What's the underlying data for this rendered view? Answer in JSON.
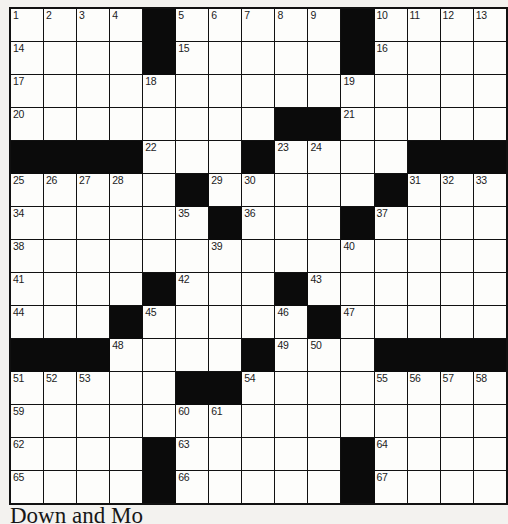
{
  "document": {
    "type": "crossword-puzzle-grid",
    "rows": 16,
    "columns": 15,
    "colors": {
      "page_background": "#f3f2ef",
      "cell_fill": "#fdfdfb",
      "block_fill": "#0b0b0b",
      "grid_line": "#111111",
      "number_text": "#1b1b1b"
    }
  },
  "caption": {
    "text": "Down and Mo"
  },
  "grid": {
    "legend": {
      "0": "open white cell",
      "1": "black blocked cell"
    },
    "blocks": [
      [
        0,
        0,
        0,
        0,
        1,
        0,
        0,
        0,
        0,
        0,
        1,
        0,
        0,
        0,
        0
      ],
      [
        0,
        0,
        0,
        0,
        1,
        0,
        0,
        0,
        0,
        0,
        1,
        0,
        0,
        0,
        0
      ],
      [
        0,
        0,
        0,
        0,
        0,
        0,
        0,
        0,
        0,
        0,
        0,
        0,
        0,
        0,
        0
      ],
      [
        0,
        0,
        0,
        0,
        0,
        0,
        0,
        0,
        1,
        1,
        0,
        0,
        0,
        0,
        0
      ],
      [
        1,
        1,
        1,
        1,
        0,
        0,
        0,
        1,
        0,
        0,
        0,
        0,
        1,
        1,
        1
      ],
      [
        0,
        0,
        0,
        0,
        0,
        1,
        0,
        0,
        0,
        0,
        0,
        1,
        0,
        0,
        0
      ],
      [
        0,
        0,
        0,
        0,
        0,
        0,
        1,
        0,
        0,
        0,
        1,
        0,
        0,
        0,
        0
      ],
      [
        0,
        0,
        0,
        0,
        0,
        0,
        0,
        0,
        0,
        0,
        0,
        0,
        0,
        0,
        0
      ],
      [
        0,
        0,
        0,
        0,
        1,
        0,
        0,
        0,
        1,
        0,
        0,
        0,
        0,
        0,
        0
      ],
      [
        0,
        0,
        0,
        1,
        0,
        0,
        0,
        0,
        0,
        1,
        0,
        0,
        0,
        0,
        0
      ],
      [
        1,
        1,
        1,
        0,
        0,
        0,
        0,
        1,
        0,
        0,
        0,
        1,
        1,
        1,
        1
      ],
      [
        0,
        0,
        0,
        0,
        0,
        1,
        1,
        0,
        0,
        0,
        0,
        0,
        0,
        0,
        0
      ],
      [
        0,
        0,
        0,
        0,
        0,
        0,
        0,
        0,
        0,
        0,
        0,
        0,
        0,
        0,
        0
      ],
      [
        0,
        0,
        0,
        0,
        1,
        0,
        0,
        0,
        0,
        0,
        1,
        0,
        0,
        0,
        0
      ],
      [
        0,
        0,
        0,
        0,
        1,
        0,
        0,
        0,
        0,
        0,
        1,
        0,
        0,
        0,
        0
      ]
    ],
    "numbers": [
      {
        "row": 0,
        "col": 0,
        "n": "1"
      },
      {
        "row": 0,
        "col": 1,
        "n": "2"
      },
      {
        "row": 0,
        "col": 2,
        "n": "3"
      },
      {
        "row": 0,
        "col": 3,
        "n": "4"
      },
      {
        "row": 0,
        "col": 5,
        "n": "5"
      },
      {
        "row": 0,
        "col": 6,
        "n": "6"
      },
      {
        "row": 0,
        "col": 7,
        "n": "7"
      },
      {
        "row": 0,
        "col": 8,
        "n": "8"
      },
      {
        "row": 0,
        "col": 9,
        "n": "9"
      },
      {
        "row": 0,
        "col": 11,
        "n": "10"
      },
      {
        "row": 0,
        "col": 12,
        "n": "11"
      },
      {
        "row": 0,
        "col": 13,
        "n": "12"
      },
      {
        "row": 0,
        "col": 14,
        "n": "13"
      },
      {
        "row": 1,
        "col": 0,
        "n": "14"
      },
      {
        "row": 1,
        "col": 5,
        "n": "15"
      },
      {
        "row": 1,
        "col": 11,
        "n": "16"
      },
      {
        "row": 2,
        "col": 0,
        "n": "17"
      },
      {
        "row": 2,
        "col": 4,
        "n": "18"
      },
      {
        "row": 2,
        "col": 10,
        "n": "19"
      },
      {
        "row": 3,
        "col": 0,
        "n": "20"
      },
      {
        "row": 3,
        "col": 10,
        "n": "21"
      },
      {
        "row": 4,
        "col": 4,
        "n": "22"
      },
      {
        "row": 4,
        "col": 8,
        "n": "23"
      },
      {
        "row": 4,
        "col": 9,
        "n": "24"
      },
      {
        "row": 5,
        "col": 0,
        "n": "25"
      },
      {
        "row": 5,
        "col": 1,
        "n": "26"
      },
      {
        "row": 5,
        "col": 2,
        "n": "27"
      },
      {
        "row": 5,
        "col": 3,
        "n": "28"
      },
      {
        "row": 5,
        "col": 6,
        "n": "29"
      },
      {
        "row": 5,
        "col": 7,
        "n": "30"
      },
      {
        "row": 5,
        "col": 12,
        "n": "31"
      },
      {
        "row": 5,
        "col": 13,
        "n": "32"
      },
      {
        "row": 5,
        "col": 14,
        "n": "33"
      },
      {
        "row": 6,
        "col": 0,
        "n": "34"
      },
      {
        "row": 6,
        "col": 5,
        "n": "35"
      },
      {
        "row": 6,
        "col": 7,
        "n": "36"
      },
      {
        "row": 6,
        "col": 11,
        "n": "37"
      },
      {
        "row": 7,
        "col": 0,
        "n": "38"
      },
      {
        "row": 7,
        "col": 6,
        "n": "39"
      },
      {
        "row": 7,
        "col": 10,
        "n": "40"
      },
      {
        "row": 8,
        "col": 0,
        "n": "41"
      },
      {
        "row": 8,
        "col": 5,
        "n": "42"
      },
      {
        "row": 8,
        "col": 9,
        "n": "43"
      },
      {
        "row": 9,
        "col": 0,
        "n": "44"
      },
      {
        "row": 9,
        "col": 4,
        "n": "45"
      },
      {
        "row": 9,
        "col": 8,
        "n": "46"
      },
      {
        "row": 9,
        "col": 10,
        "n": "47"
      },
      {
        "row": 10,
        "col": 3,
        "n": "48"
      },
      {
        "row": 10,
        "col": 8,
        "n": "49"
      },
      {
        "row": 10,
        "col": 9,
        "n": "50"
      },
      {
        "row": 11,
        "col": 0,
        "n": "51"
      },
      {
        "row": 11,
        "col": 1,
        "n": "52"
      },
      {
        "row": 11,
        "col": 2,
        "n": "53"
      },
      {
        "row": 11,
        "col": 7,
        "n": "54"
      },
      {
        "row": 11,
        "col": 11,
        "n": "55"
      },
      {
        "row": 11,
        "col": 12,
        "n": "56"
      },
      {
        "row": 11,
        "col": 13,
        "n": "57"
      },
      {
        "row": 11,
        "col": 14,
        "n": "58"
      },
      {
        "row": 12,
        "col": 0,
        "n": "59"
      },
      {
        "row": 12,
        "col": 5,
        "n": "60"
      },
      {
        "row": 12,
        "col": 6,
        "n": "61"
      },
      {
        "row": 13,
        "col": 0,
        "n": "62"
      },
      {
        "row": 13,
        "col": 5,
        "n": "63"
      },
      {
        "row": 13,
        "col": 11,
        "n": "64"
      },
      {
        "row": 14,
        "col": 0,
        "n": "65"
      },
      {
        "row": 14,
        "col": 5,
        "n": "66"
      },
      {
        "row": 14,
        "col": 11,
        "n": "67"
      }
    ]
  }
}
